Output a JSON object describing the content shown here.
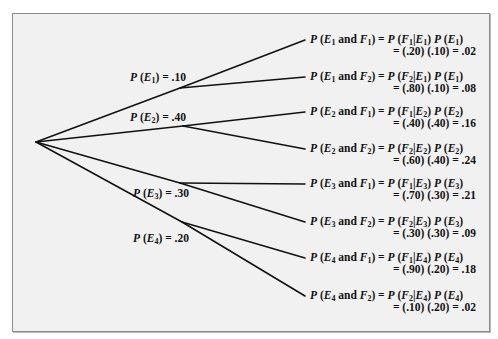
{
  "diagram": {
    "type": "probability-tree",
    "root": {
      "x": 36,
      "y": 142
    },
    "first_level": [
      {
        "event": "E1",
        "sub": "1",
        "prob": ".10",
        "node": {
          "x": 180,
          "y": 88
        },
        "label_pos": {
          "x": 130,
          "y": 71
        }
      },
      {
        "event": "E2",
        "sub": "2",
        "prob": ".40",
        "node": {
          "x": 183,
          "y": 126
        },
        "label_pos": {
          "x": 130,
          "y": 111
        }
      },
      {
        "event": "E3",
        "sub": "3",
        "prob": ".30",
        "node": {
          "x": 180,
          "y": 183
        },
        "label_pos": {
          "x": 133,
          "y": 187
        }
      },
      {
        "event": "E4",
        "sub": "4",
        "prob": ".20",
        "node": {
          "x": 182,
          "y": 222
        },
        "label_pos": {
          "x": 133,
          "y": 232
        }
      }
    ],
    "leaves": [
      {
        "parent": 0,
        "e": "1",
        "f": "1",
        "cond": ".20",
        "pe": ".10",
        "joint": ".02",
        "end": {
          "x": 305,
          "y": 40
        },
        "top": 33
      },
      {
        "parent": 0,
        "e": "1",
        "f": "2",
        "cond": ".80",
        "pe": ".10",
        "joint": ".08",
        "end": {
          "x": 305,
          "y": 77
        },
        "top": 70
      },
      {
        "parent": 1,
        "e": "2",
        "f": "1",
        "cond": ".40",
        "pe": ".40",
        "joint": ".16",
        "end": {
          "x": 305,
          "y": 112
        },
        "top": 105
      },
      {
        "parent": 1,
        "e": "2",
        "f": "2",
        "cond": ".60",
        "pe": ".40",
        "joint": ".24",
        "end": {
          "x": 305,
          "y": 149
        },
        "top": 142
      },
      {
        "parent": 2,
        "e": "3",
        "f": "1",
        "cond": ".70",
        "pe": ".30",
        "joint": ".21",
        "end": {
          "x": 305,
          "y": 184
        },
        "top": 177
      },
      {
        "parent": 2,
        "e": "3",
        "f": "2",
        "cond": ".30",
        "pe": ".30",
        "joint": ".09",
        "end": {
          "x": 305,
          "y": 222
        },
        "top": 215
      },
      {
        "parent": 3,
        "e": "4",
        "f": "1",
        "cond": ".90",
        "pe": ".20",
        "joint": ".18",
        "end": {
          "x": 305,
          "y": 258
        },
        "top": 251
      },
      {
        "parent": 3,
        "e": "4",
        "f": "2",
        "cond": ".10",
        "pe": ".20",
        "joint": ".02",
        "end": {
          "x": 305,
          "y": 296
        },
        "top": 289
      }
    ]
  },
  "text": {
    "p": "P",
    "and": "and",
    "equals": "=",
    "e_letter": "E",
    "f_letter": "F"
  }
}
